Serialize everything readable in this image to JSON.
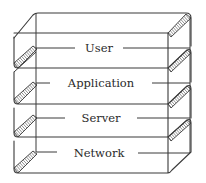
{
  "diagram": {
    "type": "layered-stack",
    "layers": [
      {
        "label": "User"
      },
      {
        "label": "Application"
      },
      {
        "label": "Server"
      },
      {
        "label": "Network"
      }
    ],
    "colors": {
      "stroke": "#3a3a3a",
      "text": "#2a2a2a",
      "background": "#ffffff"
    }
  }
}
